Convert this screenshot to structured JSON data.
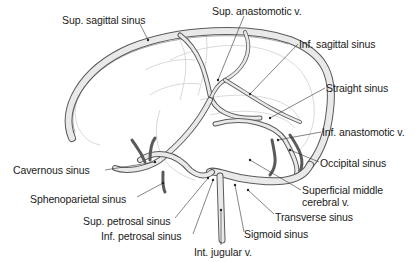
{
  "figure": {
    "colors": {
      "background": "#ffffff",
      "ink": "#1a1a1a",
      "vessel_outline": "#5a5a5a",
      "vessel_fill": "#e9e9e9",
      "faint_brain_outline": "#c9c9c9"
    }
  },
  "labels": [
    {
      "id": "sup-sagittal-sinus",
      "text": "Sup. sagittal sinus",
      "x": 62,
      "y": 14
    },
    {
      "id": "sup-anastomotic-v",
      "text": "Sup. anastomotic v.",
      "x": 212,
      "y": 5
    },
    {
      "id": "inf-sagittal-sinus",
      "text": "Inf. sagittal sinus",
      "x": 299,
      "y": 38
    },
    {
      "id": "straight-sinus",
      "text": "Straight sinus",
      "x": 326,
      "y": 82
    },
    {
      "id": "inf-anastomotic-v",
      "text": "Inf. anastomotic v.",
      "x": 322,
      "y": 126
    },
    {
      "id": "occipital-sinus",
      "text": "Occipital sinus",
      "x": 320,
      "y": 157
    },
    {
      "id": "superficial-middle-cerebral-v",
      "text": "Superficial middle cerebral v.",
      "x": 302,
      "y": 184
    },
    {
      "id": "transverse-sinus",
      "text": "Transverse sinus",
      "x": 275,
      "y": 211
    },
    {
      "id": "sigmoid-sinus",
      "text": "Sigmoid sinus",
      "x": 244,
      "y": 228
    },
    {
      "id": "cavernous-sinus",
      "text": "Cavernous sinus",
      "x": 13,
      "y": 164
    },
    {
      "id": "sphenoparietal-sinus",
      "text": "Sphenoparietal sinus",
      "x": 30,
      "y": 193
    },
    {
      "id": "sup-petrosal-sinus",
      "text": "Sup. petrosal sinus",
      "x": 83,
      "y": 215
    },
    {
      "id": "inf-petrosal-sinus",
      "text": "Inf. petrosal sinus",
      "x": 101,
      "y": 230
    },
    {
      "id": "int-jugular-v",
      "text": "Int. jugular v.",
      "x": 194,
      "y": 246
    }
  ]
}
